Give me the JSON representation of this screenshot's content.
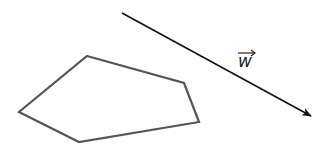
{
  "diagram": {
    "polygon": {
      "name": "pentagon",
      "stroke": "#555555",
      "stroke_width": 2.2,
      "points": [
        [
          87,
          56
        ],
        [
          184,
          83
        ],
        [
          199,
          122
        ],
        [
          79,
          142
        ],
        [
          19,
          112
        ]
      ]
    },
    "vector": {
      "label": "w",
      "stroke": "#111111",
      "stroke_width": 1.6,
      "start": [
        122,
        13
      ],
      "end": [
        311,
        116
      ]
    }
  }
}
